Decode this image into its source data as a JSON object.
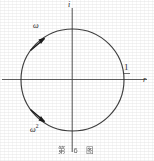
{
  "figure": {
    "caption": "第 6 图",
    "axes": {
      "vertical_label": "i",
      "horizontal_label": "r",
      "origin_x": 72,
      "origin_y": 80
    },
    "circle": {
      "center_x": 72,
      "center_y": 80,
      "radius": 51,
      "stroke": "#2b2b2b"
    },
    "points": [
      {
        "name": "one",
        "label": "1",
        "angle_deg": 0,
        "label_x": 124,
        "label_y": 63
      },
      {
        "name": "omega",
        "label": "ω",
        "angle_deg": 135,
        "marker_x": 36,
        "marker_y": 44
      },
      {
        "name": "omega-squared",
        "label": "ω",
        "superscript": "2",
        "angle_deg": 225,
        "marker_x": 36,
        "marker_y": 116
      }
    ],
    "colors": {
      "ink": "#2b2b2b",
      "axis": "#4a4a4a",
      "paper": "#ffffff"
    }
  }
}
